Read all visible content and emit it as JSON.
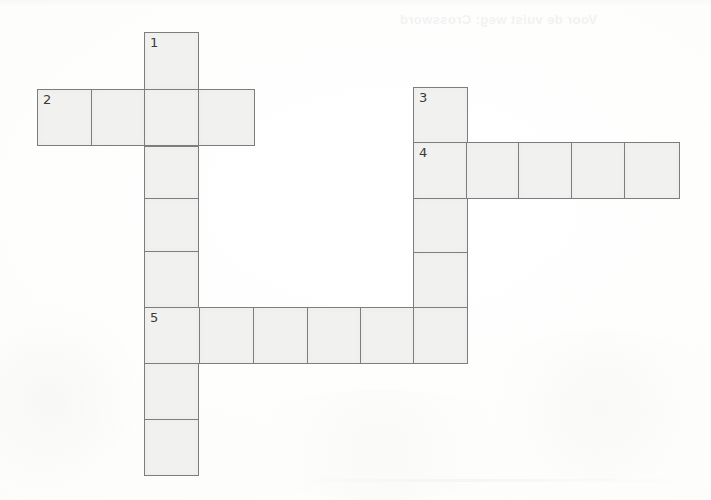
{
  "page": {
    "kind": "crossword-grid",
    "width": 711,
    "height": 500,
    "background_color": "#fcfcfb",
    "cell_fill_color": "#f1f1ef",
    "cell_border_color": "#7d7d7d",
    "number_color": "#3a3a3a",
    "cell_size_px": 54,
    "faint_bleed_text": "Voor de vuist weg: Crossword"
  },
  "clue_numbers": [
    "1",
    "2",
    "3",
    "4",
    "5"
  ],
  "entries": [
    {
      "number": "1",
      "direction": "down",
      "length": 8,
      "start_col": 1,
      "start_row": 0
    },
    {
      "number": "2",
      "direction": "across",
      "length": 4,
      "start_col": 0,
      "start_row": 1
    },
    {
      "number": "3",
      "direction": "down",
      "length": 5,
      "start_col": 5,
      "start_row": 1
    },
    {
      "number": "4",
      "direction": "across",
      "length": 5,
      "start_col": 5,
      "start_row": 2
    },
    {
      "number": "5",
      "direction": "across",
      "length": 6,
      "start_col": 1,
      "start_row": 6
    }
  ],
  "cells": [
    {
      "id": "c1",
      "x": 144,
      "y": 32,
      "w": 55,
      "h": 58,
      "number": "1",
      "letter": ""
    },
    {
      "id": "c2",
      "x": 37,
      "y": 89,
      "w": 55,
      "h": 57,
      "number": "2",
      "letter": ""
    },
    {
      "id": "c3",
      "x": 91,
      "y": 89,
      "w": 54,
      "h": 57,
      "number": "",
      "letter": ""
    },
    {
      "id": "c4",
      "x": 144,
      "y": 89,
      "w": 55,
      "h": 57,
      "number": "",
      "letter": ""
    },
    {
      "id": "c5",
      "x": 198,
      "y": 89,
      "w": 57,
      "h": 57,
      "number": "",
      "letter": ""
    },
    {
      "id": "c6",
      "x": 144,
      "y": 146,
      "w": 55,
      "h": 53,
      "number": "",
      "letter": ""
    },
    {
      "id": "c7",
      "x": 144,
      "y": 198,
      "w": 55,
      "h": 54,
      "number": "",
      "letter": ""
    },
    {
      "id": "c8",
      "x": 144,
      "y": 251,
      "w": 55,
      "h": 57,
      "number": "",
      "letter": ""
    },
    {
      "id": "c9",
      "x": 413,
      "y": 87,
      "w": 55,
      "h": 56,
      "number": "3",
      "letter": ""
    },
    {
      "id": "c10",
      "x": 413,
      "y": 142,
      "w": 55,
      "h": 57,
      "number": "4",
      "letter": ""
    },
    {
      "id": "c11",
      "x": 466,
      "y": 142,
      "w": 53,
      "h": 57,
      "number": "",
      "letter": ""
    },
    {
      "id": "c12",
      "x": 518,
      "y": 142,
      "w": 54,
      "h": 57,
      "number": "",
      "letter": ""
    },
    {
      "id": "c13",
      "x": 571,
      "y": 142,
      "w": 54,
      "h": 57,
      "number": "",
      "letter": ""
    },
    {
      "id": "c14",
      "x": 624,
      "y": 142,
      "w": 56,
      "h": 57,
      "number": "",
      "letter": ""
    },
    {
      "id": "c15",
      "x": 413,
      "y": 198,
      "w": 55,
      "h": 55,
      "number": "",
      "letter": ""
    },
    {
      "id": "c16",
      "x": 413,
      "y": 252,
      "w": 55,
      "h": 57,
      "number": "",
      "letter": ""
    },
    {
      "id": "c17",
      "x": 144,
      "y": 307,
      "w": 56,
      "h": 57,
      "number": "5",
      "letter": ""
    },
    {
      "id": "c18",
      "x": 199,
      "y": 307,
      "w": 55,
      "h": 57,
      "number": "",
      "letter": ""
    },
    {
      "id": "c19",
      "x": 253,
      "y": 307,
      "w": 55,
      "h": 57,
      "number": "",
      "letter": ""
    },
    {
      "id": "c20",
      "x": 307,
      "y": 307,
      "w": 54,
      "h": 57,
      "number": "",
      "letter": ""
    },
    {
      "id": "c21",
      "x": 360,
      "y": 307,
      "w": 54,
      "h": 57,
      "number": "",
      "letter": ""
    },
    {
      "id": "c22",
      "x": 413,
      "y": 307,
      "w": 55,
      "h": 57,
      "number": "",
      "letter": ""
    },
    {
      "id": "c23",
      "x": 144,
      "y": 363,
      "w": 55,
      "h": 57,
      "number": "",
      "letter": ""
    },
    {
      "id": "c24",
      "x": 144,
      "y": 419,
      "w": 55,
      "h": 57,
      "number": "",
      "letter": ""
    }
  ]
}
